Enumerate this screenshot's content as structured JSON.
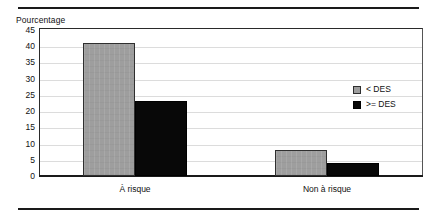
{
  "chart_data": {
    "type": "bar",
    "title": "",
    "xlabel": "",
    "ylabel": "Pourcentage",
    "categories": [
      "À risque",
      "Non à risque"
    ],
    "series": [
      {
        "name": "< DES",
        "values": [
          41,
          8
        ],
        "color": "#9e9e9e"
      },
      {
        "name": ">= DES",
        "values": [
          23,
          4
        ],
        "color": "#080808"
      }
    ],
    "ylim": [
      0,
      45
    ],
    "ytick_values": [
      45,
      40,
      35,
      30,
      25,
      20,
      15,
      10,
      5,
      0
    ],
    "ytick_labels": [
      "45",
      "40",
      "35",
      "30",
      "25",
      "20",
      "15",
      "10",
      "5",
      "0"
    ],
    "grid": true,
    "legend_position": "upper-right"
  },
  "axis": {
    "y_title": "Pourcentage"
  },
  "legend": {
    "items": [
      {
        "label": "< DES",
        "swatch": "light"
      },
      {
        "label": ">= DES",
        "swatch": "dark"
      }
    ]
  }
}
